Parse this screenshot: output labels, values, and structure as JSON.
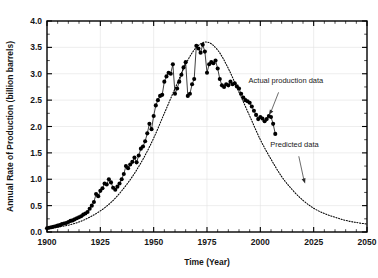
{
  "chart_data": {
    "type": "line",
    "title": "",
    "xlabel": "Time (Year)",
    "ylabel": "Annual Rate of Production (billion barrels)",
    "xlim": [
      1900,
      2050
    ],
    "ylim": [
      0.0,
      4.0
    ],
    "xticks": [
      1900,
      1925,
      1950,
      1975,
      2000,
      2025,
      2050
    ],
    "xtick_labels": [
      "1900",
      "1925",
      "1950",
      "1975",
      "2000",
      "2025",
      "2050"
    ],
    "yticks": [
      0.0,
      0.5,
      1.0,
      1.5,
      2.0,
      2.5,
      3.0,
      3.5,
      4.0
    ],
    "ytick_labels": [
      "0.0",
      "0.5",
      "1.0",
      "1.5",
      "2.0",
      "2.5",
      "3.0",
      "3.5",
      "4.0"
    ],
    "x_minor_step": 5,
    "y_minor_step": 0.25,
    "grid": true,
    "grid_color": "#e2e2e2",
    "legend_position": "none",
    "series": [
      {
        "name": "Actual production data",
        "style": "filled-circles-with-thin-line",
        "marker_color": "#000000",
        "x": [
          1900,
          1901,
          1902,
          1903,
          1904,
          1905,
          1906,
          1907,
          1908,
          1909,
          1910,
          1911,
          1912,
          1913,
          1914,
          1915,
          1916,
          1917,
          1918,
          1919,
          1920,
          1921,
          1922,
          1923,
          1924,
          1925,
          1926,
          1927,
          1928,
          1929,
          1930,
          1931,
          1932,
          1933,
          1934,
          1935,
          1936,
          1937,
          1938,
          1939,
          1940,
          1941,
          1942,
          1943,
          1944,
          1945,
          1946,
          1947,
          1948,
          1949,
          1950,
          1951,
          1952,
          1953,
          1954,
          1955,
          1956,
          1957,
          1958,
          1959,
          1960,
          1961,
          1962,
          1963,
          1964,
          1965,
          1966,
          1967,
          1968,
          1969,
          1970,
          1971,
          1972,
          1973,
          1974,
          1975,
          1976,
          1977,
          1978,
          1979,
          1980,
          1981,
          1982,
          1983,
          1984,
          1985,
          1986,
          1987,
          1988,
          1989,
          1990,
          1991,
          1992,
          1993,
          1994,
          1995,
          1996,
          1997,
          1998,
          1999,
          2000,
          2001,
          2002,
          2003,
          2004,
          2005,
          2006,
          2007
        ],
        "y": [
          0.07,
          0.08,
          0.09,
          0.1,
          0.11,
          0.12,
          0.13,
          0.15,
          0.16,
          0.17,
          0.19,
          0.21,
          0.22,
          0.24,
          0.26,
          0.28,
          0.3,
          0.33,
          0.35,
          0.38,
          0.44,
          0.5,
          0.57,
          0.72,
          0.68,
          0.78,
          0.83,
          0.92,
          0.9,
          1.0,
          0.94,
          0.84,
          0.8,
          0.86,
          0.92,
          1.0,
          1.1,
          1.25,
          1.21,
          1.28,
          1.33,
          1.41,
          1.32,
          1.45,
          1.58,
          1.62,
          1.72,
          1.87,
          2.05,
          1.95,
          2.2,
          2.4,
          2.5,
          2.58,
          2.6,
          2.85,
          2.95,
          3.02,
          3.0,
          3.18,
          2.62,
          2.72,
          2.85,
          2.98,
          3.12,
          3.22,
          2.58,
          2.62,
          2.8,
          2.9,
          3.53,
          3.48,
          3.4,
          3.55,
          3.42,
          3.02,
          3.18,
          3.22,
          3.2,
          3.25,
          3.1,
          2.9,
          2.78,
          2.75,
          2.8,
          2.78,
          2.85,
          2.8,
          2.82,
          2.76,
          2.72,
          2.62,
          2.55,
          2.5,
          2.48,
          2.45,
          2.38,
          2.3,
          2.22,
          2.14,
          2.18,
          2.15,
          2.1,
          2.14,
          2.2,
          2.18,
          2.05,
          1.86
        ]
      },
      {
        "name": "Predicted data",
        "style": "dotted-curve",
        "curve_color": "#000000",
        "x": [
          1900,
          1905,
          1910,
          1915,
          1920,
          1925,
          1930,
          1935,
          1940,
          1945,
          1950,
          1955,
          1960,
          1965,
          1970,
          1975,
          1980,
          1985,
          1990,
          1995,
          2000,
          2005,
          2010,
          2015,
          2020,
          2025,
          2030,
          2035,
          2040,
          2045,
          2050
        ],
        "y": [
          0.06,
          0.09,
          0.13,
          0.19,
          0.28,
          0.4,
          0.56,
          0.78,
          1.05,
          1.38,
          1.78,
          2.25,
          2.72,
          3.18,
          3.5,
          3.6,
          3.45,
          3.1,
          2.65,
          2.2,
          1.75,
          1.38,
          1.05,
          0.8,
          0.6,
          0.45,
          0.35,
          0.28,
          0.22,
          0.18,
          0.15
        ]
      }
    ],
    "annotations": [
      {
        "name": "actual-production-annotation",
        "text": "Actual production data",
        "text_x": 2012,
        "text_y": 2.82,
        "arrow_to_x": 2004,
        "arrow_to_y": 2.22
      },
      {
        "name": "predicted-data-annotation",
        "text": "Predicted data",
        "text_x": 2016,
        "text_y": 1.62,
        "arrow_to_x": 2021,
        "arrow_to_y": 0.92
      }
    ]
  }
}
